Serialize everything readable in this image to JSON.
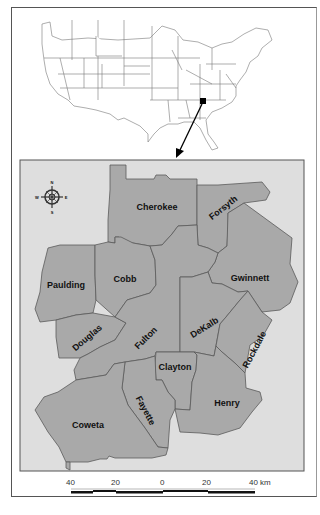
{
  "figure": {
    "inset_title": "",
    "locator": {
      "region": "United States (contiguous)",
      "marker": "Atlanta metropolitan area, Georgia"
    },
    "compass": {
      "north": "N",
      "south": "S",
      "east": "E",
      "west": "W"
    },
    "counties": [
      {
        "name": "Cherokee"
      },
      {
        "name": "Forsyth"
      },
      {
        "name": "Paulding"
      },
      {
        "name": "Cobb"
      },
      {
        "name": "Gwinnett"
      },
      {
        "name": "Douglas"
      },
      {
        "name": "Fulton"
      },
      {
        "name": "DeKalb"
      },
      {
        "name": "Rockdale"
      },
      {
        "name": "Clayton"
      },
      {
        "name": "Fayette"
      },
      {
        "name": "Henry"
      },
      {
        "name": "Coweta"
      }
    ],
    "scale_bar": {
      "labels": [
        "40",
        "20",
        "0",
        "20",
        "40 km"
      ]
    },
    "colors": {
      "county_fill": "#a9a9a9",
      "county_stroke": "#555555",
      "map_background": "#dedede",
      "us_map_stroke": "#666666"
    }
  }
}
